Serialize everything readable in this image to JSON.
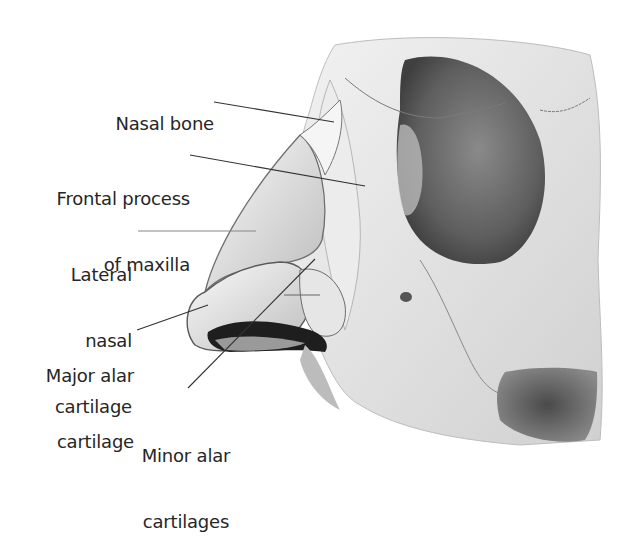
{
  "figure": {
    "colors": {
      "background": "#ffffff",
      "bone_light": "#ededed",
      "bone_mid": "#c8c8c8",
      "orbit_dark": "#6b6b6b",
      "shadow": "#2a2a2a",
      "leader_line": "#333333",
      "text": "#262626"
    }
  },
  "labels": [
    {
      "id": "nasal-bone",
      "line1": "Nasal bone",
      "line2": "",
      "line3": ""
    },
    {
      "id": "frontal-process",
      "line1": "Frontal process",
      "line2": "of maxilla",
      "line3": ""
    },
    {
      "id": "lateral-nasal-cartilage",
      "line1": "Lateral",
      "line2": "nasal",
      "line3": "cartilage"
    },
    {
      "id": "major-alar-cartilage",
      "line1": "Major alar",
      "line2": "cartilage",
      "line3": ""
    },
    {
      "id": "minor-alar-cartilages",
      "line1": "Minor alar",
      "line2": "cartilages",
      "line3": ""
    }
  ]
}
